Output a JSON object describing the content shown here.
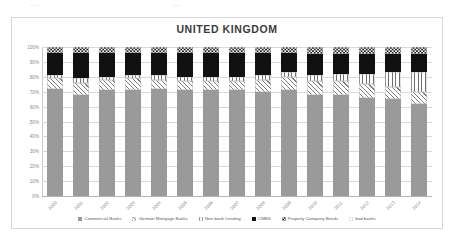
{
  "top_artifacts": [
    {
      "text": "——",
      "left": 30,
      "top": 2
    },
    {
      "text": "——",
      "left": 173,
      "top": 2
    }
  ],
  "chart_data": {
    "type": "bar",
    "subtype": "stacked-100-percent",
    "title": "UNITED KINGDOM",
    "xlabel": "",
    "ylabel": "",
    "ylim": [
      0,
      100
    ],
    "grid": true,
    "legend_position": "bottom",
    "categories": [
      "2000",
      "2001",
      "2002",
      "2003",
      "2004",
      "2005",
      "2006",
      "2007",
      "2008",
      "2009",
      "2010",
      "2011",
      "2012",
      "2013",
      "2014"
    ],
    "ytick_labels": [
      "0%",
      "10%",
      "20%",
      "30%",
      "40%",
      "50%",
      "60%",
      "70%",
      "80%",
      "90%",
      "100%"
    ],
    "ytick_values": [
      0,
      10,
      20,
      30,
      40,
      50,
      60,
      70,
      80,
      90,
      100
    ],
    "series": [
      {
        "name": "Commercial Banks",
        "pattern": "solid-gray",
        "color": "#9a9a9a",
        "values": [
          72,
          68,
          71,
          71,
          72,
          71,
          71,
          71,
          70,
          71,
          68,
          68,
          66,
          65,
          62
        ]
      },
      {
        "name": "German Mortgage Banks",
        "pattern": "diagonal-hatch",
        "color": "#7d7d7d",
        "values": [
          7,
          8,
          7,
          8,
          6,
          6,
          6,
          6,
          8,
          9,
          9,
          9,
          9,
          8,
          8
        ]
      },
      {
        "name": "Non-bank Lending",
        "pattern": "vertical-stripe",
        "color": "#6e6e6e",
        "values": [
          2,
          3,
          2,
          2,
          3,
          3,
          3,
          3,
          3,
          3,
          4,
          5,
          7,
          10,
          13
        ]
      },
      {
        "name": "CMBS",
        "pattern": "solid-black",
        "color": "#111111",
        "values": [
          15,
          17,
          16,
          15,
          15,
          16,
          16,
          16,
          15,
          13,
          14,
          13,
          13,
          12,
          12
        ]
      },
      {
        "name": "Property Company Bonds",
        "pattern": "checkerboard",
        "color": "#1d1d1d",
        "values": [
          4,
          4,
          4,
          4,
          4,
          4,
          4,
          4,
          4,
          4,
          5,
          5,
          5,
          5,
          5
        ]
      },
      {
        "name": "bad banks",
        "pattern": "white",
        "color": "#ffffff",
        "values": [
          0,
          0,
          0,
          0,
          0,
          0,
          0,
          0,
          0,
          0,
          0,
          0,
          0,
          0,
          0
        ]
      }
    ]
  }
}
